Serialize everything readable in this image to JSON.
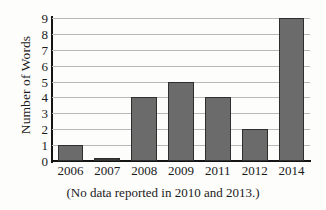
{
  "chart_data": {
    "type": "bar",
    "title": "",
    "subtitle": "",
    "xlabel": "",
    "ylabel": "Number of Words",
    "categories": [
      "2006",
      "2007",
      "2008",
      "2009",
      "2011",
      "2012",
      "2014"
    ],
    "values": [
      1,
      0,
      4,
      5,
      4,
      2,
      9
    ],
    "series": [
      {
        "name": "Number of Words",
        "values": [
          1,
          0,
          4,
          5,
          4,
          2,
          9
        ]
      }
    ],
    "ylim": [
      0,
      9
    ],
    "ytick_labels": [
      "0",
      "1",
      "2",
      "3",
      "4",
      "5",
      "6",
      "7",
      "8",
      "9"
    ],
    "ytick_values": [
      0,
      1,
      2,
      3,
      4,
      5,
      6,
      7,
      8,
      9
    ],
    "grid": true,
    "grid_axis": "y",
    "legend": false,
    "legend_position": "none",
    "annotations": [
      "(No data reported in 2010 and 2013.)"
    ],
    "bar_color": "#6b6b6b",
    "bar_edge_color": "#2e2e2e",
    "gridline_color": "#b9b9b9",
    "axis_color": "#141414",
    "background_color": "#fdfdfc"
  },
  "caption": {
    "text": "(No data reported in 2010 and 2013.)"
  }
}
